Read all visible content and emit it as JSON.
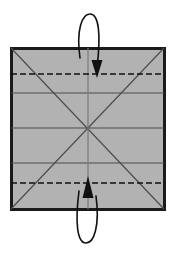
{
  "figure": {
    "title": "Paper folding step diagram",
    "description": "Square sheet with pre-creased guide lines; top and bottom edges are folded inward to the dashed crease lines.",
    "background_color": "#ffffff"
  },
  "sheet": {
    "name": "square-sheet",
    "fill_color": "#b2b2b2",
    "border_color": "#1a1a1a",
    "border_width": 3,
    "x": 11,
    "y": 48,
    "width": 153,
    "height": 161
  },
  "crease_lines": {
    "solid_color": "#4d4d4d",
    "dashed_color": "#111111",
    "solid_width": 1.2,
    "dashed_width": 1.6,
    "dash_pattern": "6 3",
    "horizontal_solid": [
      {
        "label": "upper-quarter-crease",
        "y": 93
      },
      {
        "label": "center-crease",
        "y": 128
      },
      {
        "label": "lower-quarter-crease",
        "y": 163
      }
    ],
    "horizontal_dashed": [
      {
        "label": "top-fold-crease",
        "y": 74
      },
      {
        "label": "bottom-fold-crease",
        "y": 183
      }
    ],
    "diagonals": [
      {
        "label": "diagonal-tl-br",
        "x1": 11,
        "y1": 48,
        "x2": 164,
        "y2": 209
      },
      {
        "label": "diagonal-bl-tr",
        "x1": 11,
        "y1": 209,
        "x2": 164,
        "y2": 48
      }
    ],
    "vertical_center": {
      "label": "vertical-center-crease",
      "x": 88,
      "y1": 48,
      "y2": 209
    }
  },
  "arrows": {
    "stroke_color": "#111111",
    "stroke_width": 1.6,
    "head_color": "#111111",
    "top": {
      "name": "fold-down-arrow",
      "direction": "down",
      "meaning": "Fold the top edge down to the dashed crease",
      "tail_x": 80,
      "tail_y": 60,
      "apex_y": 14,
      "head_x": 97,
      "head_y": 76
    },
    "bottom": {
      "name": "fold-up-arrow",
      "direction": "up",
      "meaning": "Fold the bottom edge up to the dashed crease",
      "tail_x": 96,
      "tail_y": 198,
      "apex_y": 243,
      "head_x": 88,
      "head_y": 180
    }
  }
}
